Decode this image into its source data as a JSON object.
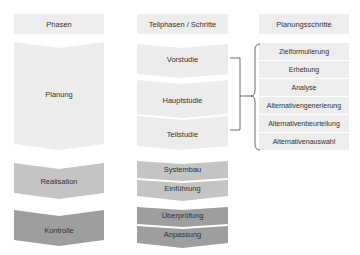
{
  "headers": {
    "phases": "Phasen",
    "subphases": "Teilphasen / Schritte",
    "planning_steps": "Planungsschritte"
  },
  "phases": [
    {
      "label": "Planung",
      "color": "#ececec"
    },
    {
      "label": "Realisation",
      "color": "#c4c4c4"
    },
    {
      "label": "Kontrolle",
      "color": "#9e9e9e"
    }
  ],
  "subphases": {
    "planung": [
      "Vorstudie",
      "Hauptstudie",
      "Teilstudie"
    ],
    "realisation": [
      "Systembau",
      "Einführung"
    ],
    "kontrolle": [
      "Überprüfung",
      "Anpassung"
    ]
  },
  "planning_steps": [
    "Zielformulierung",
    "Erhebung",
    "Analyse",
    "Alternativengenerierung",
    "Alternativenbeurteilung",
    "Alternativenauswahl"
  ],
  "colors": {
    "light": "#ececec",
    "mid": "#c4c4c4",
    "dark": "#9e9e9e",
    "line": "#444444",
    "text": "#333333"
  }
}
